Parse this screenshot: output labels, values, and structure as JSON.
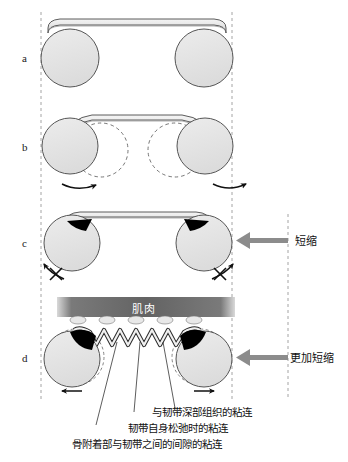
{
  "figure": {
    "title": "",
    "panels": [
      {
        "id": "a",
        "letter": "a"
      },
      {
        "id": "b",
        "letter": "b"
      },
      {
        "id": "c",
        "letter": "c"
      },
      {
        "id": "d",
        "letter": "d"
      }
    ]
  },
  "labels": {
    "muscle": "肌肉",
    "shortening": "短缩",
    "further_shortening": "更加短缩"
  },
  "captions": [
    "与韧带深部组织的粘连",
    "韧带自身松弛时的粘连",
    "骨附着部与韧带之间的间隙的粘连"
  ],
  "colors": {
    "bone_fill": "#e3e3e3",
    "bone_stroke": "#555555",
    "ligament_fill": "#ebebeb",
    "ligament_stroke": "#4a4a4a",
    "adhesion": "#000000",
    "muscle_band": "#6d6d6d",
    "arrow_gray": "#8c8c8c",
    "guide_dash": "#9a9a9a",
    "background": "#ffffff"
  }
}
